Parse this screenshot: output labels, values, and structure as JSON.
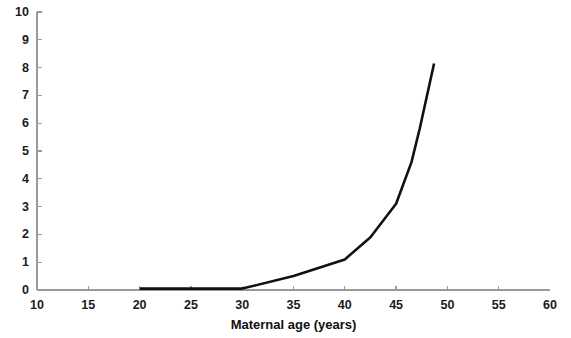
{
  "chart_data": {
    "type": "line",
    "title": "",
    "subtitle": "",
    "xlabel": "Maternal age (years)",
    "ylabel": "",
    "xlim": [
      10,
      60
    ],
    "ylim": [
      0,
      10
    ],
    "xticks": [
      10,
      15,
      20,
      25,
      30,
      35,
      40,
      45,
      50,
      55,
      60
    ],
    "yticks": [
      0,
      1,
      2,
      3,
      4,
      5,
      6,
      7,
      8,
      9,
      10
    ],
    "xtick_labels": [
      "10",
      "15",
      "20",
      "25",
      "30",
      "35",
      "40",
      "45",
      "50",
      "55",
      "60"
    ],
    "ytick_labels": [
      "0",
      "1",
      "2",
      "3",
      "4",
      "5",
      "6",
      "7",
      "8",
      "9",
      "10"
    ],
    "grid": false,
    "legend": false,
    "legend_position": "none",
    "series": [
      {
        "name": "Risk by maternal age",
        "color": "#111111",
        "line_width": 2.6,
        "x": [
          20,
          25,
          30,
          35,
          40,
          42.5,
          45,
          46.5,
          47.3,
          48.7
        ],
        "values": [
          0.05,
          0.05,
          0.05,
          0.5,
          1.1,
          1.9,
          3.1,
          4.6,
          5.8,
          8.15
        ]
      }
    ],
    "annotations": []
  },
  "axis_style": {
    "axis_color": "#9a9a9a",
    "tick_color": "#9a9a9a",
    "text_color": "#141414",
    "background": "#ffffff"
  }
}
